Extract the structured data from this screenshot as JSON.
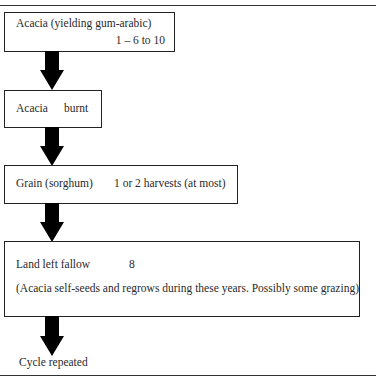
{
  "diagram": {
    "type": "flowchart",
    "steps": [
      {
        "label": "Acacia (yielding gum-arabic)",
        "detail": "1 – 6 to 10"
      },
      {
        "label": "Acacia",
        "detail": "burnt"
      },
      {
        "label": "Grain (sorghum)",
        "detail": "1 or 2 harvests (at most)"
      },
      {
        "label": "Land left fallow",
        "detail": "8",
        "note": "(Acacia self-seeds and regrows during these years. Possibly some grazing)"
      }
    ],
    "end_label": "Cycle repeated",
    "arrow_color": "#000000",
    "border_color": "#222222"
  }
}
